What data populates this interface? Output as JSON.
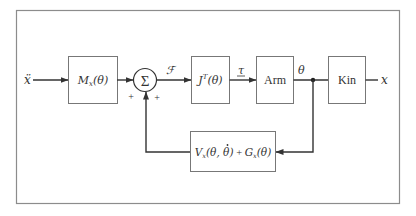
{
  "diagram": {
    "colors": {
      "frame": "#8c8c8c",
      "line": "#333333",
      "box_border": "#777777",
      "background": "#ffffff"
    },
    "input": {
      "label": "ẍ"
    },
    "output": {
      "label": "x"
    },
    "blocks": {
      "mass": {
        "label_main": "M",
        "label_sub": "x",
        "label_arg": "(θ)"
      },
      "jacobian": {
        "label_main": "J",
        "label_sup": "T",
        "label_arg": "(θ)"
      },
      "arm": {
        "label": "Arm"
      },
      "kin": {
        "label": "Kin"
      },
      "feedback": {
        "v_main": "V",
        "v_sub": "x",
        "v_arg_open": "(θ, ",
        "v_arg_dot": "θ",
        "v_arg_close": ")",
        "plus": " + ",
        "g_main": "G",
        "g_sub": "x",
        "g_arg": "(θ)"
      }
    },
    "summing_junction": {
      "symbol": "Σ",
      "signs": [
        "+",
        "+"
      ]
    },
    "signals": {
      "force": "ℱ",
      "torque": "τ",
      "joint_angle": "θ"
    }
  }
}
